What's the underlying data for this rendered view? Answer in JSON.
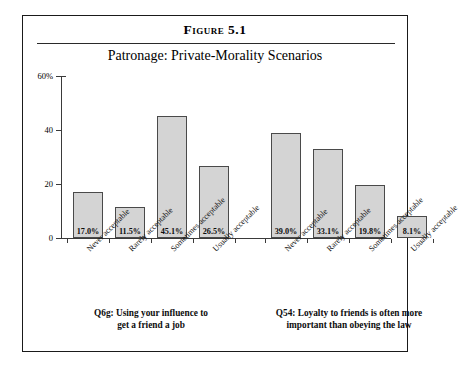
{
  "figure": {
    "number": "Figure 5.1",
    "subtitle": "Patronage: Private-Morality Scenarios"
  },
  "chart_data": {
    "type": "bar",
    "title": "Patronage: Private-Morality Scenarios",
    "xlabel": "",
    "ylabel": "",
    "ylim": [
      0,
      60
    ],
    "yticks": [
      "0",
      "20",
      "40",
      "60%"
    ],
    "grid": false,
    "legend": null,
    "categories": [
      "Never acceptable",
      "Rarely acceptable",
      "Sometimes acceptable",
      "Usually acceptable"
    ],
    "groups": [
      {
        "caption_line1": "Q6g: Using your influence to",
        "caption_line2": "get a friend a job",
        "values": [
          17.0,
          11.5,
          45.1,
          26.5
        ],
        "labels": [
          "17.0%",
          "11.5%",
          "45.1%",
          "26.5%"
        ]
      },
      {
        "caption_line1": "Q54: Loyalty to friends is often more",
        "caption_line2": "important than obeying the law",
        "values": [
          39.0,
          33.1,
          19.8,
          8.1
        ],
        "labels": [
          "39.0%",
          "33.1%",
          "19.8%",
          "8.1%"
        ]
      }
    ],
    "bar_fill": "#d4d4d4",
    "bar_border": "#4a4a4a"
  }
}
